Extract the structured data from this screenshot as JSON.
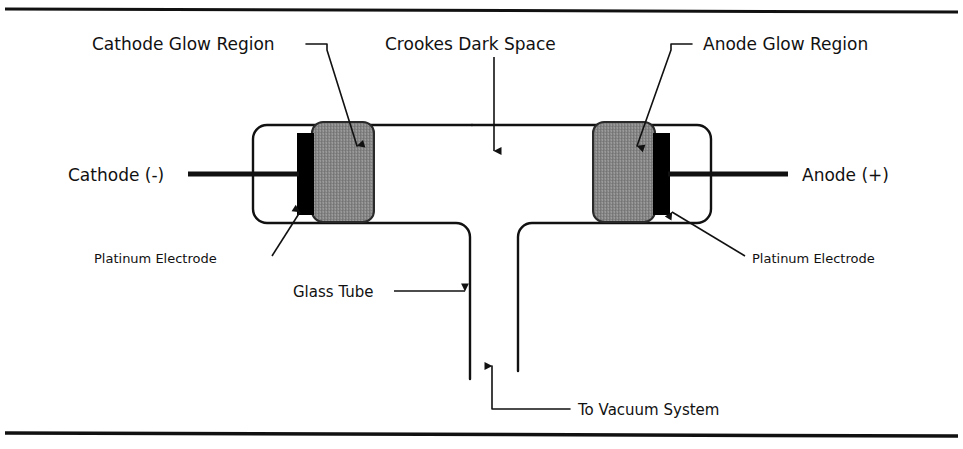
{
  "figure": {
    "colors": {
      "ink": "#111111",
      "glow_fill": "#8c8c8c",
      "electrode_fill": "#000000",
      "background": "#ffffff",
      "rule": "#111111"
    }
  },
  "labels": {
    "cathode_glow_region": "Cathode Glow Region",
    "crookes_dark_space": "Crookes Dark Space",
    "anode_glow_region": "Anode Glow Region",
    "cathode": "Cathode (-)",
    "anode": "Anode (+)",
    "platinum_electrode_left": "Platinum Electrode",
    "platinum_electrode_right": "Platinum Electrode",
    "glass_tube": "Glass Tube",
    "to_vacuum_system": "To Vacuum System"
  },
  "parts": [
    {
      "id": "glass-tube-body",
      "name": "Glass Tube"
    },
    {
      "id": "cathode-glow-region",
      "name": "Cathode Glow Region"
    },
    {
      "id": "anode-glow-region",
      "name": "Anode Glow Region"
    },
    {
      "id": "cathode-electrode",
      "name": "Platinum Electrode (Cathode)"
    },
    {
      "id": "anode-electrode",
      "name": "Platinum Electrode (Anode)"
    },
    {
      "id": "crookes-dark-space",
      "name": "Crookes Dark Space"
    },
    {
      "id": "vacuum-spout",
      "name": "To Vacuum System"
    }
  ]
}
